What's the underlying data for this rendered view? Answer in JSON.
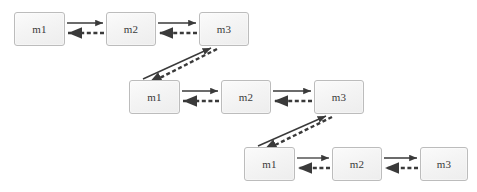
{
  "diagram": {
    "background_color": "#ffffff",
    "node_fill": "#f2f2f2",
    "node_border_color": "#bcbcbc",
    "edge_color": "#3a3a3a",
    "label_color": "#3a3a3a",
    "rows": [
      {
        "row_id": "row-1",
        "nodes": [
          {
            "id": "r1-m1",
            "label": "m1",
            "x": 14,
            "y": 12,
            "w": 51,
            "h": 34
          },
          {
            "id": "r1-m2",
            "label": "m2",
            "x": 106,
            "y": 12,
            "w": 50,
            "h": 34
          },
          {
            "id": "r1-m3",
            "label": "m3",
            "x": 199,
            "y": 12,
            "w": 50,
            "h": 34
          }
        ],
        "edges": [
          {
            "from": "r1-m1",
            "to": "r1-m2",
            "style": "solid",
            "direction": "forward"
          },
          {
            "from": "r1-m2",
            "to": "r1-m1",
            "style": "dashed",
            "direction": "backward"
          },
          {
            "from": "r1-m2",
            "to": "r1-m3",
            "style": "solid",
            "direction": "forward"
          },
          {
            "from": "r1-m3",
            "to": "r1-m2",
            "style": "dashed",
            "direction": "backward"
          }
        ]
      },
      {
        "row_id": "row-2",
        "nodes": [
          {
            "id": "r2-m1",
            "label": "m1",
            "x": 129,
            "y": 80,
            "w": 51,
            "h": 34
          },
          {
            "id": "r2-m2",
            "label": "m2",
            "x": 221,
            "y": 80,
            "w": 50,
            "h": 34
          },
          {
            "id": "r2-m3",
            "label": "m3",
            "x": 314,
            "y": 80,
            "w": 50,
            "h": 34
          }
        ],
        "edges": [
          {
            "from": "r2-m1",
            "to": "r2-m2",
            "style": "solid",
            "direction": "forward"
          },
          {
            "from": "r2-m2",
            "to": "r2-m1",
            "style": "dashed",
            "direction": "backward"
          },
          {
            "from": "r2-m2",
            "to": "r2-m3",
            "style": "solid",
            "direction": "forward"
          },
          {
            "from": "r2-m3",
            "to": "r2-m2",
            "style": "dashed",
            "direction": "backward"
          }
        ]
      },
      {
        "row_id": "row-3",
        "nodes": [
          {
            "id": "r3-m1",
            "label": "m1",
            "x": 244,
            "y": 147,
            "w": 51,
            "h": 34
          },
          {
            "id": "r3-m2",
            "label": "m2",
            "x": 332,
            "y": 147,
            "w": 50,
            "h": 34
          },
          {
            "id": "r3-m3",
            "label": "m3",
            "x": 420,
            "y": 147,
            "w": 48,
            "h": 34
          }
        ],
        "edges": [
          {
            "from": "r3-m1",
            "to": "r3-m2",
            "style": "solid",
            "direction": "forward"
          },
          {
            "from": "r3-m2",
            "to": "r3-m1",
            "style": "dashed",
            "direction": "backward"
          },
          {
            "from": "r3-m2",
            "to": "r3-m3",
            "style": "solid",
            "direction": "forward"
          },
          {
            "from": "r3-m3",
            "to": "r3-m2",
            "style": "dashed",
            "direction": "backward"
          }
        ]
      }
    ],
    "cross_row_edges": [
      {
        "id": "diag-1",
        "from": "r2-m1",
        "to": "r1-m3",
        "style": "solid",
        "direction": "up-right",
        "x1": 143,
        "y1": 79,
        "x2": 211,
        "y2": 47
      },
      {
        "id": "diag-1-return",
        "from": "r1-m3",
        "to": "r2-m1",
        "style": "dashed",
        "direction": "down-left",
        "x1": 216,
        "y1": 48,
        "x2": 147,
        "y2": 83
      },
      {
        "id": "diag-2",
        "from": "r3-m1",
        "to": "r2-m3",
        "style": "solid",
        "direction": "up-right",
        "x1": 258,
        "y1": 146,
        "x2": 326,
        "y2": 115
      },
      {
        "id": "diag-2-return",
        "from": "r2-m3",
        "to": "r3-m1",
        "style": "dashed",
        "direction": "down-left",
        "x1": 331,
        "y1": 116,
        "x2": 262,
        "y2": 150
      }
    ]
  }
}
